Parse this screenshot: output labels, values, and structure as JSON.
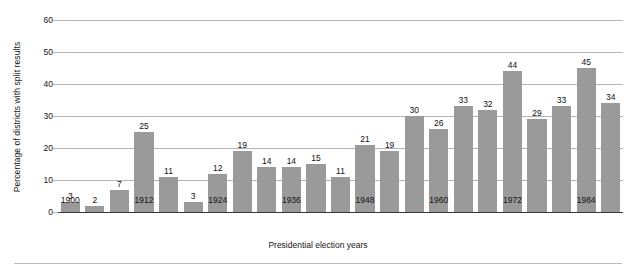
{
  "chart_data": {
    "type": "bar",
    "title": "",
    "xlabel": "Presidential election years",
    "ylabel": "Percentage of districts with split results",
    "categories": [
      "1900",
      "1904",
      "1908",
      "1912",
      "1916",
      "1920",
      "1924",
      "1928",
      "1932",
      "1936",
      "1940",
      "1944",
      "1948",
      "1952",
      "1956",
      "1960",
      "1964",
      "1968",
      "1972",
      "1976",
      "1980",
      "1984",
      "1988"
    ],
    "values": [
      3,
      2,
      7,
      25,
      11,
      3,
      12,
      19,
      14,
      14,
      15,
      11,
      21,
      19,
      30,
      26,
      33,
      32,
      44,
      29,
      33,
      45,
      34
    ],
    "ylim": [
      0,
      60
    ],
    "yticks": [
      "0",
      "10",
      "20",
      "30",
      "40",
      "50",
      "60"
    ],
    "xtick_labels": [
      "1900",
      "1912",
      "1924",
      "1936",
      "1948",
      "1960",
      "1972",
      "1984"
    ],
    "xtick_indices": [
      0,
      3,
      6,
      9,
      12,
      15,
      18,
      21
    ],
    "grid": true,
    "legend": false,
    "bar_color": "#9a9a9a",
    "grid_color": "#b4b4b4",
    "axis_color": "#3a3a3a",
    "data_labels": true
  }
}
